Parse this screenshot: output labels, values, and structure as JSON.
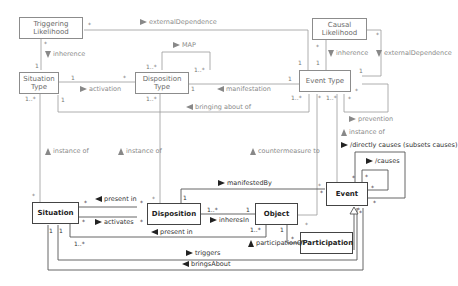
{
  "diagram": {
    "type": "UML class diagram",
    "classes": {
      "triggering_likelihood": "Triggering Likelihood",
      "situation_type": "Situation Type",
      "disposition_type": "Disposition Type",
      "event_type": "Event Type",
      "causal_likelihood": "Causal Likelihood",
      "situation": "Situation",
      "disposition": "Disposition",
      "object": "Object",
      "event": "Event",
      "participation": "/Participation"
    },
    "associations": {
      "external_dependence_top": "externalDependence",
      "inherence_left": "inherence",
      "map": "MAP",
      "activation": "activation",
      "manifestation": "manifestation",
      "bringing_about_of": "bringing about of",
      "inherence_right": "inherence",
      "external_dependence_right": "externalDependence",
      "prevention": "prevention",
      "instance_of_event": "instance of",
      "directly_causes": "/directly causes (subsets causes)",
      "causes": "/causes",
      "instance_of_situation": "instance of",
      "instance_of_disposition": "instance of",
      "countermeasure_to": "countermeasure to",
      "manifested_by": "manifestedBy",
      "present_in_top": "present in",
      "activates": "activates",
      "inheres_in": "inheresIn",
      "present_in_bottom": "present in",
      "participation_of": "participationOf",
      "triggers": "triggers",
      "brings_about": "bringsAbout"
    },
    "multiplicities": {
      "one": "1",
      "many": "*",
      "one_or_more": "1..*"
    }
  }
}
